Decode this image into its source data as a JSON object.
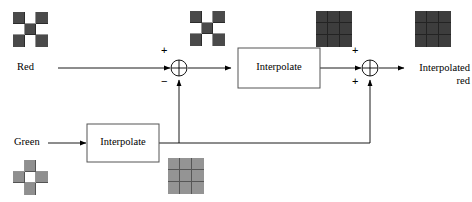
{
  "diagram": {
    "colors": {
      "line": "#000000",
      "box_border": "#555555",
      "dark": "#4a4a4a",
      "mid": "#8f8f8f",
      "light": "#ffffff",
      "uniform_dark": "#3d3d3d",
      "uniform_mid": "#949494"
    },
    "inputs": [
      {
        "id": "red",
        "label": "Red"
      },
      {
        "id": "green",
        "label": "Green"
      }
    ],
    "blocks": [
      {
        "id": "interpolate-red",
        "label": "Interpolate"
      },
      {
        "id": "interpolate-green",
        "label": "Interpolate"
      }
    ],
    "summing_junctions": [
      {
        "id": "sum-1",
        "top_sign": "+",
        "bottom_sign": "−"
      },
      {
        "id": "sum-2",
        "top_sign": "+",
        "bottom_sign": "+"
      }
    ],
    "output": {
      "id": "interpolated-red",
      "line1": "Interpolated",
      "line2": "red"
    },
    "patches": [
      {
        "id": "patch-red-input",
        "name": "red-mosaic-patch",
        "kind": "checker",
        "cells": [
          "dark",
          "light",
          "dark",
          "light",
          "dark",
          "light",
          "dark",
          "light",
          "dark"
        ]
      },
      {
        "id": "patch-red-difference",
        "name": "red-difference-patch",
        "kind": "checker",
        "cells": [
          "dark",
          "light",
          "dark",
          "light",
          "dark",
          "light",
          "dark",
          "light",
          "dark"
        ]
      },
      {
        "id": "patch-interpolated-difference",
        "name": "interpolated-difference-patch",
        "kind": "uniform",
        "cells": [
          "uniform_dark",
          "uniform_dark",
          "uniform_dark",
          "uniform_dark",
          "uniform_dark",
          "uniform_dark",
          "uniform_dark",
          "uniform_dark",
          "uniform_dark"
        ]
      },
      {
        "id": "patch-interpolated-red",
        "name": "interpolated-red-patch",
        "kind": "uniform",
        "cells": [
          "uniform_dark",
          "uniform_dark",
          "uniform_dark",
          "uniform_dark",
          "uniform_dark",
          "uniform_dark",
          "uniform_dark",
          "uniform_dark",
          "uniform_dark"
        ]
      },
      {
        "id": "patch-green-input",
        "name": "green-mosaic-patch",
        "kind": "checker",
        "cells": [
          "light",
          "mid",
          "light",
          "mid",
          "light",
          "mid",
          "light",
          "mid",
          "light"
        ]
      },
      {
        "id": "patch-interpolated-green",
        "name": "interpolated-green-patch",
        "kind": "uniform",
        "cells": [
          "uniform_mid",
          "uniform_mid",
          "uniform_mid",
          "uniform_mid",
          "uniform_mid",
          "uniform_mid",
          "uniform_mid",
          "uniform_mid",
          "uniform_mid"
        ]
      }
    ]
  }
}
